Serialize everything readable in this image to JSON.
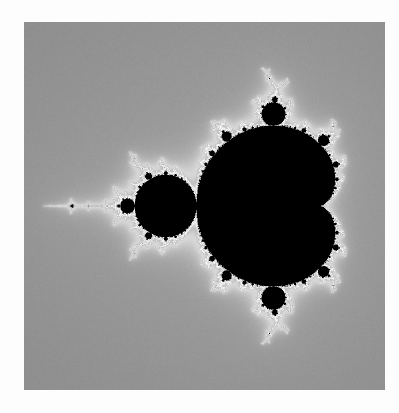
{
  "figure": {
    "caption": "",
    "background_color": "#fdfdfd",
    "border_color": "#ffffff"
  },
  "image_panel": {
    "name": "mandelbrot-render",
    "x": 24,
    "y": 22,
    "width": 361,
    "height": 368,
    "colormap": "grayscale",
    "interior_color": "#000000",
    "exterior_colors": [
      "#4f4f4f",
      "#585858",
      "#636363",
      "#6e6e6e",
      "#7a7a7a",
      "#888888",
      "#989898",
      "#a8a8a8",
      "#b8b8b8",
      "#c8c8c8",
      "#d8d8d8",
      "#e6e6e6"
    ]
  },
  "chart_data": {
    "type": "heatmap",
    "xlabel": "Re(c)",
    "ylabel": "Im(c)",
    "xlim": [
      -2.15,
      0.78
    ],
    "ylim": [
      -1.49,
      1.49
    ],
    "grid": false,
    "legend": "none",
    "max_iterations": 220,
    "escape_radius": 4,
    "color_scheme": "grayscale-banded",
    "smooth_shading": true,
    "band_period": 11.5,
    "band_gamma": 0.52,
    "noise_amplitude": 0.018,
    "features": [
      {
        "name": "main-cardioid",
        "label": "Main cardioid (period 1)",
        "center_px": [
          362,
          205
        ],
        "approx_radius_px": 95,
        "re": 0.26,
        "im": 0.0
      },
      {
        "name": "period-2-bulb",
        "label": "Period-2 disk",
        "center_px": [
          257,
          205
        ],
        "approx_radius_px": 23,
        "re": -1.0,
        "im": 0.0
      },
      {
        "name": "period-3-upper-bulb",
        "label": "Upper period-3 bulb",
        "center_px": [
          316,
          104
        ],
        "approx_radius_px": 13,
        "re": -0.125,
        "im": 0.745
      },
      {
        "name": "period-3-lower-bulb",
        "label": "Lower period-3 bulb",
        "center_px": [
          316,
          301
        ],
        "approx_radius_px": 13,
        "re": -0.125,
        "im": -0.745
      },
      {
        "name": "period-3-mini-set",
        "label": "Period-3 mini Mandelbrot",
        "center_px": [
          94,
          205
        ],
        "approx_radius_px": 9,
        "re": -1.754,
        "im": 0.0
      },
      {
        "name": "antenna",
        "label": "Real-axis antenna filament",
        "center_px": [
          150,
          205
        ],
        "approx_radius_px": 0,
        "re": -1.5,
        "im": 0.0
      }
    ]
  }
}
